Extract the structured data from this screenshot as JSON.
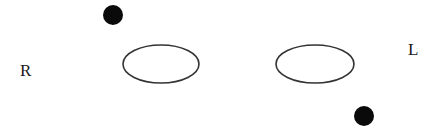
{
  "diagram": {
    "labels": {
      "right_side": "R",
      "left_side": "L"
    },
    "colors": {
      "stroke": "#333333",
      "dot": "#0a0a0a",
      "background": "#ffffff"
    },
    "shapes": {
      "ellipses": [
        {
          "name": "left-ellipse",
          "cx": 161,
          "cy": 64,
          "rx": 38,
          "ry": 19
        },
        {
          "name": "right-ellipse",
          "cx": 315,
          "cy": 64,
          "rx": 39,
          "ry": 19
        }
      ],
      "dots": [
        {
          "name": "upper-dot",
          "cx": 113,
          "cy": 15,
          "r": 10
        },
        {
          "name": "lower-dot",
          "cx": 364,
          "cy": 116,
          "r": 10
        }
      ]
    }
  }
}
